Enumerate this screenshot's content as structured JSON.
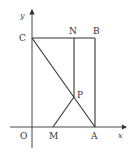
{
  "diagram": {
    "type": "geometry-coordinate-figure",
    "axes": {
      "x_label": "x",
      "y_label": "y",
      "origin_label": "O"
    },
    "points": {
      "C": "C",
      "N": "N",
      "B": "B",
      "P": "P",
      "M": "M",
      "A": "A"
    },
    "segments": [
      "CB",
      "BA",
      "CA",
      "NM",
      "NP",
      "PM"
    ],
    "colors": {
      "stroke": "#333333",
      "background": "#ffffff"
    }
  }
}
